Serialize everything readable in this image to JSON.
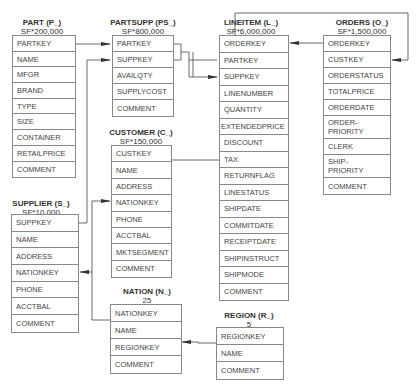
{
  "tables": {
    "part": {
      "title": "PART (P_)",
      "sf": "SF*200,000",
      "fields": [
        "PARTKEY",
        "NAME",
        "MFGR",
        "BRAND",
        "TYPE",
        "SIZE",
        "CONTAINER",
        "RETAILPRICE",
        "COMMENT"
      ]
    },
    "partsupp": {
      "title": "PARTSUPP (PS_)",
      "sf": "SF*800,000",
      "fields": [
        "PARTKEY",
        "SUPPKEY",
        "AVAILQTY",
        "SUPPLYCOST",
        "COMMENT"
      ]
    },
    "lineitem": {
      "title": "LINEITEM (L_)",
      "sf": "SF*6,000,000",
      "fields": [
        "ORDERKEY",
        "PARTKEY",
        "SUPPKEY",
        "LINENUMBER",
        "QUANTITY",
        "EXTENDEDPRICE",
        "DISCOUNT",
        "TAX",
        "RETURNFLAG",
        "LINESTATUS",
        "SHIPDATE",
        "COMMITDATE",
        "RECEIPTDATE",
        "SHIPINSTRUCT",
        "SHIPMODE",
        "COMMENT"
      ]
    },
    "orders": {
      "title": "ORDERS (O_)",
      "sf": "SF*1,500,000",
      "fields": [
        "ORDERKEY",
        "CUSTKEY",
        "ORDERSTATUS",
        "TOTALPRICE",
        "ORDERDATE",
        "ORDER-\nPRIORITY",
        "CLERK",
        "SHIP-\nPRIORITY",
        "COMMENT"
      ]
    },
    "customer": {
      "title": "CUSTOMER (C_)",
      "sf": "SF*150,000",
      "fields": [
        "CUSTKEY",
        "NAME",
        "ADDRESS",
        "NATIONKEY",
        "PHONE",
        "ACCTBAL",
        "MKTSEGMENT",
        "COMMENT"
      ]
    },
    "supplier": {
      "title": "SUPPLIER (S_)",
      "sf": "SF*10,000",
      "fields": [
        "SUPPKEY",
        "NAME",
        "ADDRESS",
        "NATIONKEY",
        "PHONE",
        "ACCTBAL",
        "COMMENT"
      ]
    },
    "nation": {
      "title": "NATION (N_)",
      "sf": "25",
      "fields": [
        "NATIONKEY",
        "NAME",
        "REGIONKEY",
        "COMMENT"
      ]
    },
    "region": {
      "title": "REGION (R_)",
      "sf": "5",
      "fields": [
        "REGIONKEY",
        "NAME",
        "COMMENT"
      ]
    }
  },
  "relationships": [
    {
      "from": "PART.PARTKEY",
      "to": "PARTSUPP.PARTKEY"
    },
    {
      "from": "SUPPLIER.SUPPKEY",
      "to": "PARTSUPP.SUPPKEY"
    },
    {
      "from": "PARTSUPP.PARTKEY",
      "to": "LINEITEM.PARTKEY"
    },
    {
      "from": "PARTSUPP.SUPPKEY",
      "to": "LINEITEM.SUPPKEY"
    },
    {
      "from": "ORDERS.ORDERKEY",
      "to": "LINEITEM.ORDERKEY"
    },
    {
      "from": "CUSTOMER.CUSTKEY",
      "to": "ORDERS.CUSTKEY"
    },
    {
      "from": "NATION.NATIONKEY",
      "to": "SUPPLIER.NATIONKEY"
    },
    {
      "from": "NATION.NATIONKEY",
      "to": "CUSTOMER.NATIONKEY"
    },
    {
      "from": "REGION.REGIONKEY",
      "to": "NATION.REGIONKEY"
    }
  ]
}
